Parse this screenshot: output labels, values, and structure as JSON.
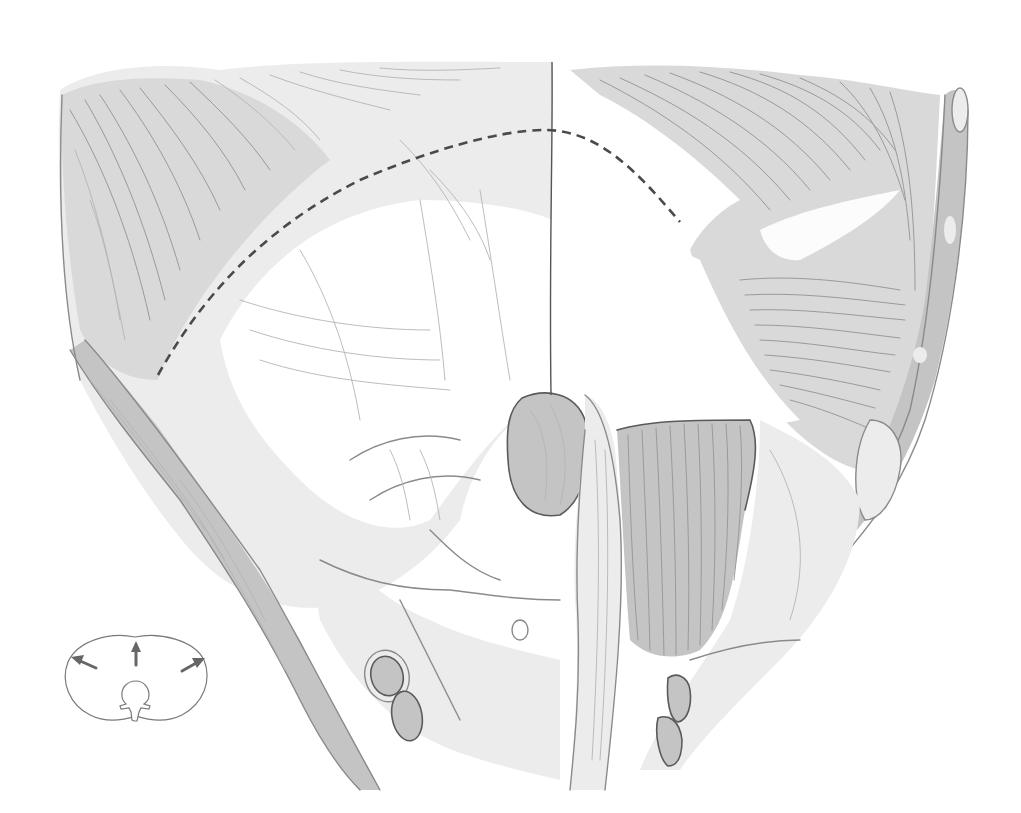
{
  "figure": {
    "title": "",
    "colors": {
      "background": "#ffffff",
      "pencil_dark": "#4a4a4a",
      "pencil_mid": "#8a8a8a",
      "pencil_light": "#c4c4c4",
      "arrow": "#666666"
    },
    "incision_line": {
      "style": "dashed",
      "path": "M158,375 C200,300 260,230 360,180 C430,150 500,130 545,130 C600,130 640,175 680,222"
    },
    "midline": {
      "path": "M552,62 C553,150 549,250 551,395"
    },
    "structures": [
      {
        "name": "left-muscle-mass",
        "label": ""
      },
      {
        "name": "right-muscle-mass",
        "label": ""
      },
      {
        "name": "central-tendon",
        "label": ""
      },
      {
        "name": "esophageal-hiatus",
        "label": ""
      },
      {
        "name": "right-crus",
        "label": ""
      },
      {
        "name": "psoas-muscle",
        "label": ""
      },
      {
        "name": "left-vessels-pair",
        "label": ""
      },
      {
        "name": "right-vessels-pair",
        "label": ""
      }
    ]
  },
  "inset": {
    "description": "Cross-section orientation diagram with three outward arrows",
    "arrows": [
      "up-left",
      "up",
      "up-right"
    ],
    "labels": []
  }
}
